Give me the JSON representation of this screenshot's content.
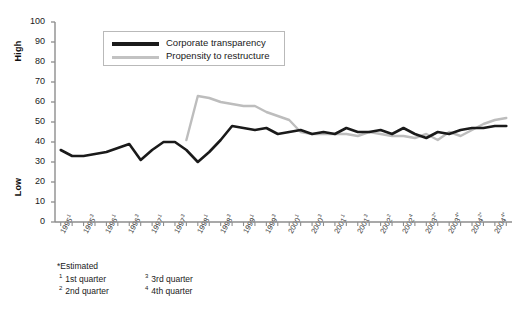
{
  "axis": {
    "y_top_label": "High",
    "y_bottom_label": "Low",
    "y_ticks": [
      "0",
      "10",
      "20",
      "30",
      "40",
      "50",
      "60",
      "70",
      "80",
      "90",
      "100"
    ]
  },
  "legend": {
    "items": [
      {
        "label": "Corporate transparency",
        "color": "#1a1a1a",
        "swatch": "legend-line-black"
      },
      {
        "label": "Propensity to restructure",
        "color": "#bdbdbd",
        "swatch": "legend-line-gray"
      }
    ]
  },
  "footnotes": {
    "estimated": "*Estimated",
    "items": [
      {
        "marker": "1",
        "text": "1st quarter"
      },
      {
        "marker": "2",
        "text": "2nd quarter"
      },
      {
        "marker": "3",
        "text": "3rd quarter"
      },
      {
        "marker": "4",
        "text": "4th quarter"
      }
    ]
  },
  "chart_data": {
    "type": "line",
    "title": "",
    "subtitle": "",
    "xlabel": "",
    "ylabel": "",
    "ylim": [
      0,
      100
    ],
    "grid": false,
    "legend_position": "top-left-inside",
    "x_tick_labels": [
      {
        "year": "1995",
        "quarter": "1",
        "estimated": false
      },
      {
        "year": "1995",
        "quarter": "3",
        "estimated": false
      },
      {
        "year": "1996",
        "quarter": "1",
        "estimated": false
      },
      {
        "year": "1996",
        "quarter": "3",
        "estimated": false
      },
      {
        "year": "1997",
        "quarter": "1",
        "estimated": false
      },
      {
        "year": "1997",
        "quarter": "3",
        "estimated": false
      },
      {
        "year": "1998",
        "quarter": "1",
        "estimated": false
      },
      {
        "year": "1998",
        "quarter": "3",
        "estimated": false
      },
      {
        "year": "1999",
        "quarter": "1",
        "estimated": false
      },
      {
        "year": "1999",
        "quarter": "3",
        "estimated": false
      },
      {
        "year": "2000",
        "quarter": "1",
        "estimated": false
      },
      {
        "year": "2000",
        "quarter": "3",
        "estimated": false
      },
      {
        "year": "2001",
        "quarter": "1",
        "estimated": false
      },
      {
        "year": "2001",
        "quarter": "3",
        "estimated": false
      },
      {
        "year": "2002",
        "quarter": "2",
        "estimated": false
      },
      {
        "year": "2002",
        "quarter": "4",
        "estimated": false
      },
      {
        "year": "2003",
        "quarter": "2",
        "estimated": true
      },
      {
        "year": "2003",
        "quarter": "4",
        "estimated": true
      },
      {
        "year": "2004",
        "quarter": "2",
        "estimated": true
      },
      {
        "year": "2004",
        "quarter": "4",
        "estimated": true
      }
    ],
    "x": [
      "1995Q1",
      "1995Q2",
      "1995Q3",
      "1995Q4",
      "1996Q1",
      "1996Q2",
      "1996Q3",
      "1996Q4",
      "1997Q1",
      "1997Q2",
      "1997Q3",
      "1997Q4",
      "1998Q1",
      "1998Q2",
      "1998Q3",
      "1998Q4",
      "1999Q1",
      "1999Q2",
      "1999Q3",
      "1999Q4",
      "2000Q1",
      "2000Q2",
      "2000Q3",
      "2000Q4",
      "2001Q1",
      "2001Q2",
      "2001Q3",
      "2001Q4",
      "2002Q1",
      "2002Q2",
      "2002Q3",
      "2002Q4",
      "2003Q1",
      "2003Q2",
      "2003Q3",
      "2003Q4",
      "2004Q1",
      "2004Q2",
      "2004Q3",
      "2004Q4"
    ],
    "series": [
      {
        "name": "Corporate transparency",
        "color": "#1a1a1a",
        "values": [
          36,
          33,
          33,
          34,
          35,
          37,
          39,
          31,
          36,
          40,
          40,
          36,
          30,
          35,
          41,
          48,
          47,
          46,
          47,
          44,
          45,
          46,
          44,
          45,
          44,
          47,
          45,
          45,
          46,
          44,
          47,
          44,
          42,
          45,
          44,
          46,
          47,
          47,
          48,
          48
        ]
      },
      {
        "name": "Propensity to restructure",
        "color": "#bdbdbd",
        "start_index": 11,
        "values": [
          null,
          null,
          null,
          null,
          null,
          null,
          null,
          null,
          null,
          null,
          null,
          41,
          63,
          62,
          60,
          59,
          58,
          58,
          55,
          53,
          51,
          45,
          44,
          44,
          44,
          44,
          43,
          45,
          44,
          43,
          43,
          42,
          44,
          41,
          45,
          43,
          46,
          49,
          51,
          52
        ]
      }
    ]
  }
}
